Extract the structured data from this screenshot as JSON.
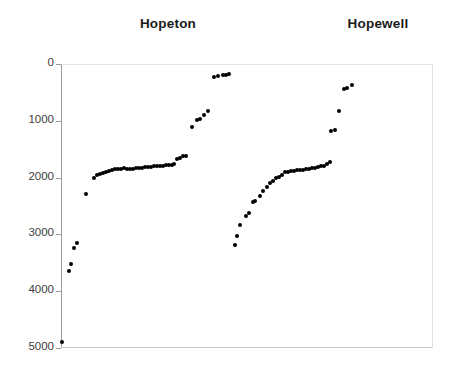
{
  "figure": {
    "background_color": "#ffffff",
    "dot_color": "#000000",
    "axis_color": "#9b9b9b",
    "plot_border_color": "#e2e2e2"
  },
  "titles": {
    "left": "Hopeton",
    "right": "Hopewell"
  },
  "axis": {
    "y_ticks": [
      {
        "label": "0",
        "value": 0
      },
      {
        "label": "1000",
        "value": 1000
      },
      {
        "label": "2000",
        "value": 2000
      },
      {
        "label": "3000",
        "value": 3000
      },
      {
        "label": "4000",
        "value": 4000
      },
      {
        "label": "5000",
        "value": 5000
      }
    ]
  },
  "chart_data": {
    "type": "scatter",
    "title": "",
    "subtitle": "",
    "xlabel": "",
    "ylabel": "",
    "xlim": [
      0,
      100
    ],
    "ylim": [
      5000,
      0
    ],
    "y_inverted": true,
    "grid": false,
    "legend": "none",
    "annotations": [
      {
        "text": "Hopeton",
        "x": 23,
        "y": -260
      },
      {
        "text": "Hopewell",
        "x": 79,
        "y": -260
      }
    ],
    "y_tick_values": [
      0,
      1000,
      2000,
      3000,
      4000,
      5000
    ],
    "y_tick_labels": [
      "0",
      "1000",
      "2000",
      "3000",
      "4000",
      "5000"
    ],
    "series": [
      {
        "name": "Hopeton",
        "points": [
          {
            "x": 0.0,
            "y": 4880
          },
          {
            "x": 2.1,
            "y": 3665
          },
          {
            "x": 2.9,
            "y": 3540
          },
          {
            "x": 4.0,
            "y": 3255
          },
          {
            "x": 4.9,
            "y": 3175
          },
          {
            "x": 6.8,
            "y": 2310
          },
          {
            "x": 9.4,
            "y": 2030
          },
          {
            "x": 10.5,
            "y": 1985
          },
          {
            "x": 11.6,
            "y": 1965
          },
          {
            "x": 12.7,
            "y": 1945
          },
          {
            "x": 13.8,
            "y": 1930
          },
          {
            "x": 14.9,
            "y": 1915
          },
          {
            "x": 16.0,
            "y": 1900
          },
          {
            "x": 17.1,
            "y": 1890
          },
          {
            "x": 18.2,
            "y": 1885
          },
          {
            "x": 19.3,
            "y": 1880
          },
          {
            "x": 20.4,
            "y": 1875
          },
          {
            "x": 21.5,
            "y": 1880
          },
          {
            "x": 22.6,
            "y": 1880
          },
          {
            "x": 23.7,
            "y": 1880
          },
          {
            "x": 24.8,
            "y": 1875
          },
          {
            "x": 25.9,
            "y": 1870
          },
          {
            "x": 27.0,
            "y": 1865
          },
          {
            "x": 28.1,
            "y": 1860
          },
          {
            "x": 29.2,
            "y": 1850
          },
          {
            "x": 30.3,
            "y": 1845
          },
          {
            "x": 31.4,
            "y": 1840
          },
          {
            "x": 32.5,
            "y": 1840
          },
          {
            "x": 33.6,
            "y": 1835
          },
          {
            "x": 34.7,
            "y": 1830
          },
          {
            "x": 35.8,
            "y": 1825
          },
          {
            "x": 36.9,
            "y": 1820
          },
          {
            "x": 38.0,
            "y": 1815
          },
          {
            "x": 39.1,
            "y": 1810
          },
          {
            "x": 40.2,
            "y": 1700
          },
          {
            "x": 41.3,
            "y": 1690
          },
          {
            "x": 42.4,
            "y": 1660
          },
          {
            "x": 43.5,
            "y": 1650
          },
          {
            "x": 46.0,
            "y": 1135
          },
          {
            "x": 48.0,
            "y": 1020
          },
          {
            "x": 49.0,
            "y": 1005
          },
          {
            "x": 51.0,
            "y": 940
          },
          {
            "x": 53.0,
            "y": 860
          },
          {
            "x": 55.5,
            "y": 245
          },
          {
            "x": 57.0,
            "y": 235
          },
          {
            "x": 59.0,
            "y": 225
          },
          {
            "x": 60.0,
            "y": 220
          },
          {
            "x": 61.0,
            "y": 218
          }
        ]
      },
      {
        "name": "Hopewell",
        "points": [
          {
            "x": 62.5,
            "y": 3100
          },
          {
            "x": 63.0,
            "y": 2930
          },
          {
            "x": 64.0,
            "y": 2735
          },
          {
            "x": 66.0,
            "y": 2570
          },
          {
            "x": 67.0,
            "y": 2530
          },
          {
            "x": 68.5,
            "y": 2330
          },
          {
            "x": 69.2,
            "y": 2320
          },
          {
            "x": 71.0,
            "y": 2230
          },
          {
            "x": 72.0,
            "y": 2140
          },
          {
            "x": 73.5,
            "y": 2070
          },
          {
            "x": 74.5,
            "y": 1990
          },
          {
            "x": 75.6,
            "y": 1965
          },
          {
            "x": 76.7,
            "y": 1900
          },
          {
            "x": 77.8,
            "y": 1885
          },
          {
            "x": 78.9,
            "y": 1855
          },
          {
            "x": 80.0,
            "y": 1800
          },
          {
            "x": 81.1,
            "y": 1790
          },
          {
            "x": 82.2,
            "y": 1780
          },
          {
            "x": 83.3,
            "y": 1770
          },
          {
            "x": 84.4,
            "y": 1765
          },
          {
            "x": 85.5,
            "y": 1760
          },
          {
            "x": 86.6,
            "y": 1755
          },
          {
            "x": 87.7,
            "y": 1745
          },
          {
            "x": 88.8,
            "y": 1735
          },
          {
            "x": 89.9,
            "y": 1730
          },
          {
            "x": 91.0,
            "y": 1720
          },
          {
            "x": 92.1,
            "y": 1705
          },
          {
            "x": 93.2,
            "y": 1690
          },
          {
            "x": 94.3,
            "y": 1680
          },
          {
            "x": 95.4,
            "y": 1640
          },
          {
            "x": 96.5,
            "y": 1605
          },
          {
            "x": 91.5,
            "y": 1070
          },
          {
            "x": 93.0,
            "y": 1045
          },
          {
            "x": 94.5,
            "y": 720
          },
          {
            "x": 96.0,
            "y": 345
          },
          {
            "x": 97.2,
            "y": 340
          },
          {
            "x": 98.5,
            "y": 290
          }
        ]
      }
    ]
  },
  "pixel_points": {
    "hopeton": [
      [
        61,
        341
      ],
      [
        68,
        270
      ],
      [
        70,
        263
      ],
      [
        73,
        247
      ],
      [
        76,
        242
      ],
      [
        85,
        193
      ],
      [
        93,
        177
      ],
      [
        96,
        174
      ],
      [
        99,
        173
      ],
      [
        102,
        172
      ],
      [
        105,
        171
      ],
      [
        108,
        170
      ],
      [
        111,
        169
      ],
      [
        114,
        168
      ],
      [
        117,
        168
      ],
      [
        120,
        168
      ],
      [
        123,
        167
      ],
      [
        126,
        168
      ],
      [
        129,
        168
      ],
      [
        132,
        168
      ],
      [
        135,
        167
      ],
      [
        138,
        167
      ],
      [
        141,
        167
      ],
      [
        144,
        166
      ],
      [
        147,
        166
      ],
      [
        150,
        166
      ],
      [
        153,
        165
      ],
      [
        156,
        165
      ],
      [
        159,
        165
      ],
      [
        162,
        165
      ],
      [
        165,
        164
      ],
      [
        168,
        164
      ],
      [
        171,
        164
      ],
      [
        173,
        163
      ],
      [
        176,
        158
      ],
      [
        179,
        157
      ],
      [
        182,
        155
      ],
      [
        185,
        155
      ],
      [
        191,
        126
      ],
      [
        196,
        119
      ],
      [
        199,
        118
      ],
      [
        203,
        114
      ],
      [
        207,
        110
      ],
      [
        213,
        76
      ],
      [
        217,
        75
      ],
      [
        222,
        74
      ],
      [
        225,
        74
      ],
      [
        228,
        73
      ]
    ],
    "hopewell": [
      [
        234,
        244
      ],
      [
        236,
        235
      ],
      [
        239,
        224
      ],
      [
        245,
        215
      ],
      [
        248,
        212
      ],
      [
        252,
        201
      ],
      [
        254,
        200
      ],
      [
        259,
        195
      ],
      [
        262,
        190
      ],
      [
        266,
        186
      ],
      [
        269,
        182
      ],
      [
        272,
        180
      ],
      [
        275,
        177
      ],
      [
        278,
        176
      ],
      [
        281,
        174
      ],
      [
        284,
        171
      ],
      [
        287,
        171
      ],
      [
        290,
        170
      ],
      [
        293,
        170
      ],
      [
        296,
        169
      ],
      [
        299,
        169
      ],
      [
        302,
        169
      ],
      [
        305,
        168
      ],
      [
        308,
        168
      ],
      [
        311,
        167
      ],
      [
        314,
        167
      ],
      [
        317,
        166
      ],
      [
        320,
        165
      ],
      [
        323,
        165
      ],
      [
        326,
        163
      ],
      [
        329,
        161
      ],
      [
        330,
        130
      ],
      [
        334,
        129
      ],
      [
        338,
        110
      ],
      [
        343,
        88
      ],
      [
        346,
        87
      ],
      [
        351,
        84
      ]
    ]
  }
}
